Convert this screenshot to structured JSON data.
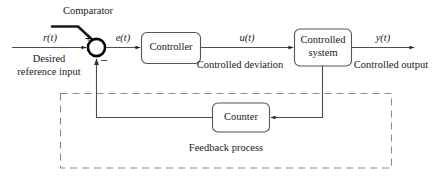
{
  "diagram": {
    "annotations": {
      "comparator": "Comparator",
      "feedback_process": "Feedback process"
    },
    "signals": [
      {
        "id": "reference",
        "symbol": "r(t)",
        "description": "Desired",
        "description2": "reference input"
      },
      {
        "id": "error",
        "symbol": "e(t)",
        "description": "",
        "description2": ""
      },
      {
        "id": "control",
        "symbol": "u(t)",
        "description": "Controlled deviation",
        "description2": ""
      },
      {
        "id": "output",
        "symbol": "y(t)",
        "description": "Controlled output",
        "description2": ""
      }
    ],
    "blocks": [
      {
        "id": "controller",
        "line1": "Controller",
        "line2": ""
      },
      {
        "id": "controlled-system",
        "line1": "Controlled",
        "line2": "system"
      },
      {
        "id": "counter",
        "line1": "Counter",
        "line2": ""
      }
    ],
    "summing_junction": {
      "plus": "+",
      "minus": "–"
    },
    "colors": {
      "line": "#4d4d4d",
      "junction": "#000000",
      "dashed_box": "#808080",
      "text": "#1a1a1a",
      "background": "#ffffff"
    }
  }
}
